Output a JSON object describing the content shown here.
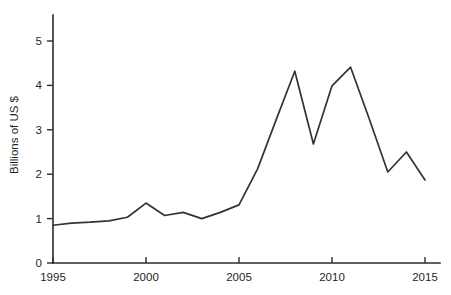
{
  "chart_data": {
    "type": "line",
    "title": "",
    "subtitle": "",
    "xlabel": "",
    "ylabel": "Billions of US $",
    "xlim": [
      1995,
      2015
    ],
    "ylim": [
      0,
      5.5
    ],
    "grid": false,
    "legend": null,
    "x_ticks": [
      1995,
      2000,
      2005,
      2010,
      2015
    ],
    "x_tick_labels": [
      "1995",
      "2000",
      "2005",
      "2010",
      "2015"
    ],
    "y_ticks": [
      0,
      1,
      2,
      3,
      4,
      5
    ],
    "y_tick_labels": [
      "0",
      "1",
      "2",
      "3",
      "4",
      "5"
    ],
    "line_color": "#333333",
    "axis_color": "#2b2b2b",
    "background_color": "#ffffff",
    "x": [
      1995,
      1996,
      1997,
      1998,
      1999,
      2000,
      2001,
      2002,
      2003,
      2004,
      2005,
      2006,
      2007,
      2008,
      2009,
      2010,
      2011,
      2012,
      2013,
      2014,
      2015
    ],
    "values": [
      0.85,
      0.9,
      0.92,
      0.95,
      1.03,
      1.35,
      1.07,
      1.14,
      1.0,
      1.14,
      1.31,
      2.12,
      3.23,
      4.32,
      2.68,
      3.99,
      4.41,
      3.25,
      2.05,
      2.5,
      1.87
    ],
    "series": [
      {
        "name": "Billions of US $",
        "values": [
          0.85,
          0.9,
          0.92,
          0.95,
          1.03,
          1.35,
          1.07,
          1.14,
          1.0,
          1.14,
          1.31,
          2.12,
          3.23,
          4.32,
          2.68,
          3.99,
          4.41,
          3.25,
          2.05,
          2.5,
          1.87
        ]
      }
    ]
  }
}
